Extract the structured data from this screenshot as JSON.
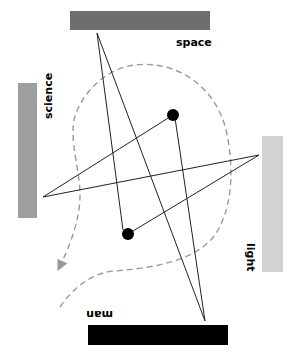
{
  "diagram": {
    "labels": {
      "space": "space",
      "science": "science",
      "light": "light",
      "man": "man"
    },
    "colors": {
      "space_bar": "#6e6e6e",
      "science_bar": "#9e9e9e",
      "light_bar": "#d2d2d2",
      "man_bar": "#000000",
      "lines": "#222222",
      "dashed_path": "#9a9a9a",
      "dots": "#000000"
    },
    "bars": [
      {
        "name": "space",
        "x": 70,
        "y": 11,
        "w": 140,
        "h": 19
      },
      {
        "name": "science",
        "x": 18,
        "y": 83,
        "w": 19,
        "h": 135
      },
      {
        "name": "light",
        "x": 262,
        "y": 136,
        "w": 21,
        "h": 136
      },
      {
        "name": "man",
        "x": 88,
        "y": 325,
        "w": 140,
        "h": 20
      }
    ],
    "vertices": {
      "top": [
        97,
        33
      ],
      "bottom": [
        205,
        321
      ],
      "left": [
        43,
        197
      ],
      "right": [
        259,
        155
      ],
      "dot_upper": [
        173,
        115
      ],
      "dot_lower": [
        128,
        234
      ]
    }
  }
}
